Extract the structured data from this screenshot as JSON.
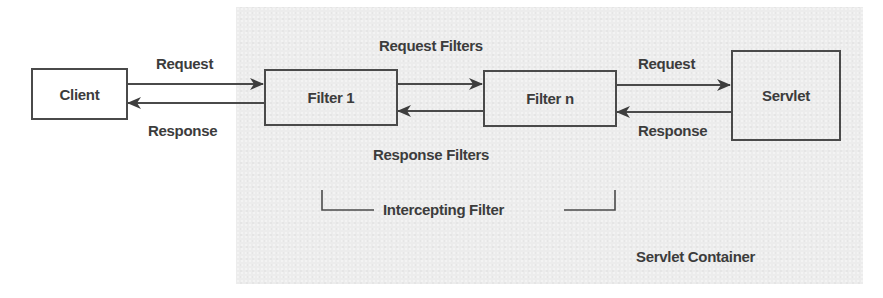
{
  "diagram": {
    "container": {
      "label": "Servlet Container",
      "background": "#ececec"
    },
    "nodes": {
      "client": {
        "label": "Client"
      },
      "filter1": {
        "label": "Filter 1"
      },
      "filtern": {
        "label": "Filter n"
      },
      "servlet": {
        "label": "Servlet"
      }
    },
    "edge_labels": {
      "client_request": "Request",
      "client_response": "Response",
      "request_filters": "Request Filters",
      "response_filters": "Response Filters",
      "servlet_request": "Request",
      "servlet_response": "Response"
    },
    "group": {
      "label": "Intercepting Filter"
    },
    "edges": [
      {
        "from": "Client",
        "to": "Filter 1",
        "label": "Request"
      },
      {
        "from": "Filter 1",
        "to": "Client",
        "label": "Response"
      },
      {
        "from": "Filter 1",
        "to": "Filter n",
        "label": "Request Filters"
      },
      {
        "from": "Filter n",
        "to": "Filter 1",
        "label": "Response Filters"
      },
      {
        "from": "Filter n",
        "to": "Servlet",
        "label": "Request"
      },
      {
        "from": "Servlet",
        "to": "Filter n",
        "label": "Response"
      }
    ],
    "colors": {
      "stroke": "#4a4a4a",
      "text": "#3c3c3c"
    }
  }
}
